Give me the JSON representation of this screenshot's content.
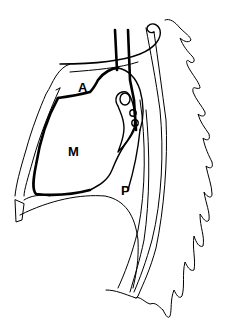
{
  "figure": {
    "type": "sagittal chest cross-section line drawing",
    "background": "#ffffff",
    "stroke_color": "#000000",
    "labels": [
      {
        "id": "A",
        "text": "A",
        "x": 78,
        "y": 92
      },
      {
        "id": "M",
        "text": "M",
        "x": 68,
        "y": 156
      },
      {
        "id": "P",
        "text": "P",
        "x": 121,
        "y": 195
      }
    ]
  }
}
